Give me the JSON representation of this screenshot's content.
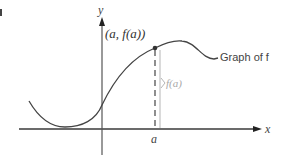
{
  "figure": {
    "label_tag": "I",
    "axes": {
      "x_label": "x",
      "y_label": "y",
      "axis_color": "#3a3a3a"
    },
    "point": {
      "label": "(a, f(a))",
      "x_tick_label": "a",
      "color": "#333333"
    },
    "curve": {
      "label": "Graph of f",
      "color": "#444444"
    },
    "height_annotation": {
      "label": "f(a)",
      "color": "#a8a8a8"
    }
  }
}
